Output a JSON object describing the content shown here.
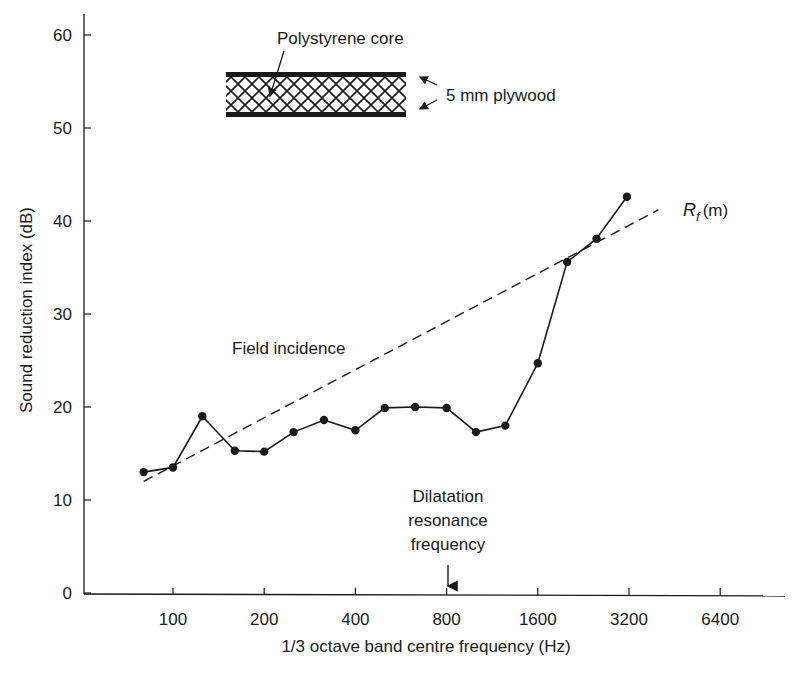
{
  "chart_data": {
    "type": "line",
    "title": "",
    "xlabel": "1/3 octave band centre frequency (Hz)",
    "ylabel": "Sound reduction index (dB)",
    "x_scale": "log2",
    "ylim": [
      0,
      60
    ],
    "y_ticks": [
      0,
      10,
      20,
      30,
      40,
      50,
      60
    ],
    "x_ticks": [
      100,
      200,
      400,
      800,
      1600,
      3200,
      6400
    ],
    "x_tick_labels": [
      "100",
      "200",
      "400",
      "800",
      "1600",
      "3200",
      "6400"
    ],
    "grid": false,
    "series": [
      {
        "name": "Measured",
        "style": "solid-markers",
        "x": [
          80,
          100,
          125,
          160,
          200,
          250,
          315,
          400,
          500,
          630,
          800,
          1000,
          1250,
          1600,
          2000,
          2500,
          3150
        ],
        "values": [
          13.0,
          13.5,
          19.0,
          15.3,
          15.2,
          17.3,
          18.6,
          17.5,
          19.9,
          20.0,
          19.9,
          17.3,
          18.0,
          24.7,
          35.6,
          38.1,
          42.6
        ]
      },
      {
        "name": "Field incidence R_f(m)",
        "style": "dashed",
        "x": [
          80,
          4000
        ],
        "values": [
          12.0,
          41.2
        ]
      }
    ],
    "annotations": [
      {
        "text": "Field incidence",
        "x_hz": 200,
        "y_db": 26.5
      },
      {
        "text": "R_f (m)",
        "x_hz": 4500,
        "y_db": 41.5
      },
      {
        "text": "Dilatation resonance frequency",
        "x_hz": 800,
        "arrow_to_axis": true
      }
    ],
    "inset": {
      "core_label": "Polystyrene core",
      "skin_label": "5 mm plywood"
    }
  },
  "labels": {
    "xlabel": "1/3 octave band centre frequency (Hz)",
    "ylabel": "Sound reduction index (dB)",
    "field_incidence": "Field incidence",
    "rf_main": "R",
    "rf_sub": "f",
    "rf_suffix": "(m)",
    "dilatation_1": "Dilatation",
    "dilatation_2": "resonance",
    "dilatation_3": "frequency",
    "core_label": "Polystyrene core",
    "skin_label": "5 mm plywood"
  },
  "colors": {
    "ink": "#1a1a1a",
    "background": "#ffffff"
  }
}
